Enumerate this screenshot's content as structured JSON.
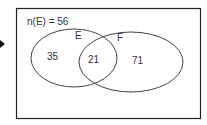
{
  "diagram": {
    "type": "venn",
    "universe_label": "n(E) = 56",
    "sets": [
      {
        "name": "E",
        "only": "35"
      },
      {
        "name": "F",
        "only": "71"
      }
    ],
    "intersection": "21"
  }
}
